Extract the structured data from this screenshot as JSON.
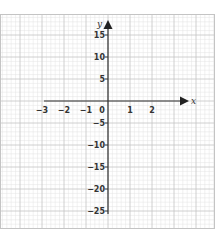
{
  "chart_data": {
    "type": "line",
    "title": "",
    "xlabel": "x",
    "ylabel": "y",
    "x_ticks": [
      -3,
      -2,
      -1,
      0,
      1,
      2
    ],
    "x_tick_labels": [
      "−3",
      "−2",
      "−1",
      "0",
      "1",
      "2"
    ],
    "y_ticks": [
      15,
      10,
      5,
      -5,
      -10,
      -15,
      -20,
      -25
    ],
    "y_tick_labels": [
      "15",
      "10",
      "5",
      "−5",
      "−10",
      "−15",
      "−20",
      "−25"
    ],
    "xlim": [
      -5,
      5
    ],
    "ylim": [
      -29,
      19
    ],
    "grid": true,
    "grid_style": "graph paper, major every 1 x-unit / 5 y-units, 5 minor subdivisions",
    "series": [],
    "legend": null
  },
  "colors": {
    "background": "#ffffff",
    "minor_grid": "#e2e2e2",
    "major_grid": "#c4c4c4",
    "axis": "#333333"
  }
}
